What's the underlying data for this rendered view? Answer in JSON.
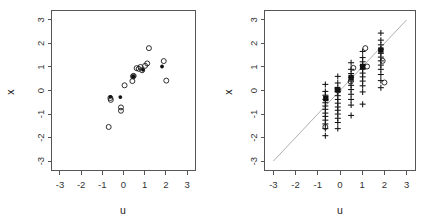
{
  "figure": {
    "background": "#ffffff",
    "panel_count": 2
  },
  "chart_data": [
    {
      "type": "scatter",
      "title": "",
      "subtitle": "",
      "xlabel": "u",
      "ylabel": "x",
      "xlim": [
        -3.4,
        3.4
      ],
      "ylim": [
        -3.4,
        3.4
      ],
      "xticks": [
        -3,
        -2,
        -1,
        0,
        1,
        2,
        3
      ],
      "yticks": [
        -3,
        -2,
        -1,
        0,
        1,
        2,
        3
      ],
      "xticklabels": [
        "-3",
        "-2",
        "-1",
        "0",
        "1",
        "2",
        "3"
      ],
      "yticklabels": [
        "-3",
        "-2",
        "-1",
        "0",
        "1",
        "2",
        "3"
      ],
      "grid": false,
      "legend": null,
      "annotations": [],
      "series": [
        {
          "name": "observed",
          "marker": "open-circle",
          "color": "#1a1a1a",
          "points": [
            [
              -0.7,
              -1.55
            ],
            [
              -0.6,
              -0.4
            ],
            [
              -0.62,
              -0.32
            ],
            [
              -0.12,
              -0.72
            ],
            [
              -0.12,
              -0.86
            ],
            [
              0.05,
              0.22
            ],
            [
              0.42,
              0.4
            ],
            [
              0.45,
              0.6
            ],
            [
              0.48,
              0.62
            ],
            [
              0.62,
              0.95
            ],
            [
              0.72,
              0.92
            ],
            [
              0.8,
              1.0
            ],
            [
              0.88,
              0.86
            ],
            [
              1.02,
              1.05
            ],
            [
              1.12,
              1.15
            ],
            [
              1.2,
              1.8
            ],
            [
              1.9,
              1.25
            ],
            [
              2.02,
              0.42
            ]
          ]
        },
        {
          "name": "fitted",
          "marker": "solid-circle",
          "color": "#111111",
          "points": [
            [
              -0.62,
              -0.27
            ],
            [
              -0.15,
              -0.28
            ],
            [
              0.46,
              0.6
            ],
            [
              0.92,
              0.88
            ],
            [
              1.82,
              1.02
            ]
          ]
        }
      ]
    },
    {
      "type": "scatter",
      "title": "",
      "subtitle": "",
      "xlabel": "u",
      "ylabel": "x",
      "xlim": [
        -3.4,
        3.4
      ],
      "ylim": [
        -3.4,
        3.4
      ],
      "xticks": [
        -3,
        -2,
        -1,
        0,
        1,
        2,
        3
      ],
      "yticks": [
        -3,
        -2,
        -1,
        0,
        1,
        2,
        3
      ],
      "xticklabels": [
        "-3",
        "-2",
        "-1",
        "0",
        "1",
        "2",
        "3"
      ],
      "yticklabels": [
        "-3",
        "-2",
        "-1",
        "0",
        "1",
        "2",
        "3"
      ],
      "grid": false,
      "legend": null,
      "annotations": [],
      "reference_line": {
        "name": "identity-line",
        "type": "line",
        "from": [
          -3,
          -3
        ],
        "to": [
          3,
          3
        ],
        "color": "#9a9a9a",
        "style": "solid"
      },
      "series": [
        {
          "name": "imputed",
          "marker": "plus",
          "color": "#111111",
          "points": [
            [
              -0.66,
              0.26
            ],
            [
              -0.66,
              -0.04
            ],
            [
              -0.66,
              -0.2
            ],
            [
              -0.66,
              -0.38
            ],
            [
              -0.66,
              -0.52
            ],
            [
              -0.66,
              -0.66
            ],
            [
              -0.66,
              -0.8
            ],
            [
              -0.66,
              -0.96
            ],
            [
              -0.66,
              -1.1
            ],
            [
              -0.66,
              -1.26
            ],
            [
              -0.66,
              -1.42
            ],
            [
              -0.66,
              -1.62
            ],
            [
              -0.66,
              -1.92
            ],
            [
              -0.1,
              0.6
            ],
            [
              -0.1,
              0.32
            ],
            [
              -0.1,
              0.1
            ],
            [
              -0.1,
              -0.06
            ],
            [
              -0.1,
              -0.22
            ],
            [
              -0.1,
              -0.38
            ],
            [
              -0.1,
              -0.54
            ],
            [
              -0.1,
              -0.7
            ],
            [
              -0.1,
              -0.84
            ],
            [
              -0.1,
              -1.0
            ],
            [
              -0.1,
              -1.18
            ],
            [
              -0.1,
              -1.36
            ],
            [
              -0.1,
              -1.62
            ],
            [
              0.5,
              1.18
            ],
            [
              0.5,
              0.9
            ],
            [
              0.5,
              0.72
            ],
            [
              0.5,
              0.56
            ],
            [
              0.5,
              0.4
            ],
            [
              0.5,
              0.22
            ],
            [
              0.5,
              0.04
            ],
            [
              0.5,
              -0.16
            ],
            [
              0.5,
              -0.38
            ],
            [
              0.5,
              -0.62
            ],
            [
              0.5,
              -1.06
            ],
            [
              1.02,
              1.66
            ],
            [
              1.02,
              1.4
            ],
            [
              1.02,
              1.22
            ],
            [
              1.02,
              1.06
            ],
            [
              1.02,
              0.9
            ],
            [
              1.02,
              0.74
            ],
            [
              1.02,
              0.58
            ],
            [
              1.02,
              0.4
            ],
            [
              1.02,
              0.2
            ],
            [
              1.02,
              -0.06
            ],
            [
              1.02,
              -0.58
            ],
            [
              1.84,
              2.44
            ],
            [
              1.84,
              2.14
            ],
            [
              1.84,
              1.94
            ],
            [
              1.84,
              1.76
            ],
            [
              1.84,
              1.58
            ],
            [
              1.84,
              1.42
            ],
            [
              1.84,
              1.26
            ],
            [
              1.84,
              1.08
            ],
            [
              1.84,
              0.9
            ],
            [
              1.84,
              0.68
            ],
            [
              1.84,
              0.42
            ],
            [
              1.84,
              0.12
            ]
          ]
        },
        {
          "name": "imputation-mean",
          "marker": "filled-square",
          "color": "#111111",
          "points": [
            [
              -0.64,
              -0.34
            ],
            [
              -0.12,
              0.04
            ],
            [
              0.5,
              0.55
            ],
            [
              1.02,
              1.02
            ],
            [
              1.84,
              1.72
            ]
          ]
        },
        {
          "name": "observed",
          "marker": "open-circle",
          "color": "#1a1a1a",
          "points": [
            [
              -0.66,
              -1.55
            ],
            [
              -0.08,
              0.0
            ],
            [
              0.48,
              0.38
            ],
            [
              0.6,
              0.96
            ],
            [
              1.14,
              1.8
            ],
            [
              1.22,
              1.02
            ],
            [
              1.92,
              1.26
            ],
            [
              2.0,
              0.34
            ]
          ]
        }
      ]
    }
  ]
}
